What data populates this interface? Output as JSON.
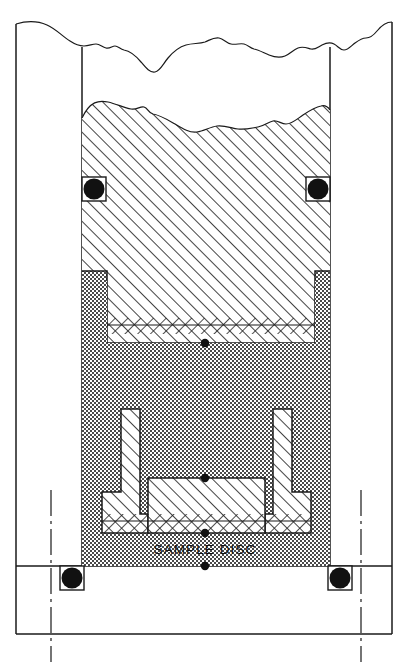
{
  "drawing": {
    "title": "Sample Disc Assembly Cross-Section",
    "type": "engineering-cross-section",
    "labels": {
      "sample_disc": "SAMPLE  DISC"
    },
    "colors": {
      "line": "#1a1a1a",
      "hatch": "#222222",
      "stipple": "#3a3a3a",
      "oring_fill": "#111111",
      "background": "#ffffff"
    },
    "components": [
      {
        "name": "outer-housing-wall",
        "fill": "none",
        "note": "outer vertical frame walls, broken at top"
      },
      {
        "name": "inner-bore-wall",
        "fill": "none",
        "note": "inner vertical walls of bore"
      },
      {
        "name": "upper-hatched-body",
        "fill": "diagonal-hatch",
        "note": "large upper plug, broken at top"
      },
      {
        "name": "stippled-chamber",
        "fill": "stipple",
        "note": "granular / packed region"
      },
      {
        "name": "left-l-bracket",
        "fill": "diagonal-hatch"
      },
      {
        "name": "right-l-bracket",
        "fill": "diagonal-hatch"
      },
      {
        "name": "sample-disc-block",
        "fill": "diagonal-hatch"
      },
      {
        "name": "o-ring-upper-left",
        "fill": "solid-black"
      },
      {
        "name": "o-ring-upper-right",
        "fill": "solid-black"
      },
      {
        "name": "o-ring-lower-left",
        "fill": "solid-black"
      },
      {
        "name": "o-ring-lower-right",
        "fill": "solid-black"
      }
    ],
    "annotations": {
      "break_line_top": "freehand torn-edge break line",
      "break_line_material": "freehand torn-edge break line across hatched body",
      "centerlines": [
        "left-centerline",
        "right-centerline"
      ],
      "axis_dots_count": 4
    }
  }
}
